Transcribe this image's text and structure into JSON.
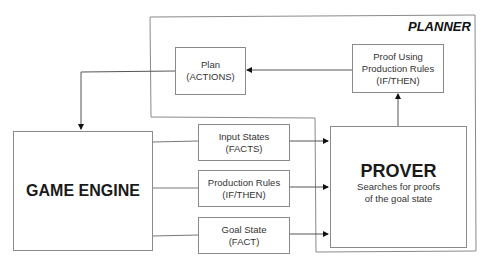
{
  "diagram": {
    "planner": {
      "title": "PLANNER"
    },
    "plan_box": {
      "line1": "Plan",
      "line2": "(ACTIONS)"
    },
    "proof_box": {
      "line1": "Proof Using",
      "line2": "Production Rules",
      "line3": "(IF/THEN)"
    },
    "game_engine": {
      "title": "GAME ENGINE"
    },
    "input_states": {
      "line1": "Input States",
      "line2": "(FACTS)"
    },
    "production_rules": {
      "line1": "Production Rules",
      "line2": "(IF/THEN)"
    },
    "goal_state": {
      "line1": "Goal State",
      "line2": "(FACT)"
    },
    "prover": {
      "title": "PROVER",
      "line1": "Searches for proofs",
      "line2": "of the goal state"
    },
    "edges": [
      {
        "from": "proof_box",
        "to": "plan_box"
      },
      {
        "from": "plan_box",
        "to": "game_engine"
      },
      {
        "from": "prover",
        "to": "proof_box"
      },
      {
        "from": "game_engine",
        "to": "prover",
        "via": "input_states"
      },
      {
        "from": "game_engine",
        "to": "prover",
        "via": "production_rules"
      },
      {
        "from": "game_engine",
        "to": "prover",
        "via": "goal_state"
      }
    ]
  }
}
